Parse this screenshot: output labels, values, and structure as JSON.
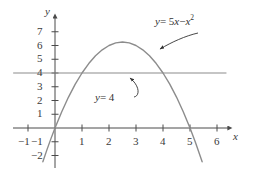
{
  "chart_data": {
    "type": "line",
    "title": "",
    "xlabel": "x",
    "ylabel": "y",
    "xlim": [
      -1.6,
      6.6
    ],
    "ylim": [
      -2.6,
      7.9
    ],
    "grid": false,
    "legend": "none",
    "xticks": [
      -1,
      1,
      2,
      3,
      4,
      5,
      6
    ],
    "xtick_labels": [
      "−1",
      "1",
      "2",
      "3",
      "4",
      "5",
      "6"
    ],
    "yticks": [
      -2,
      -1,
      1,
      2,
      3,
      4,
      5,
      6,
      7
    ],
    "ytick_labels": [
      "−2",
      "−1",
      "1",
      "2",
      "3",
      "4",
      "5",
      "6",
      "7"
    ],
    "series": [
      {
        "name": "y = 5x − x²",
        "kind": "parabola",
        "equation": "y = 5x - x^2",
        "color": "#8c8c8c",
        "vertex": [
          2.5,
          6.25
        ],
        "roots": [
          0,
          5
        ],
        "x_start": -0.45,
        "x_end": 5.45,
        "points": [
          [
            -0.45,
            -2.4525
          ],
          [
            -0.3,
            -1.59
          ],
          [
            -0.15,
            -0.7725
          ],
          [
            0,
            0
          ],
          [
            0.25,
            1.1875
          ],
          [
            0.5,
            2.25
          ],
          [
            0.75,
            3.1875
          ],
          [
            1,
            4
          ],
          [
            1.25,
            4.6875
          ],
          [
            1.5,
            5.25
          ],
          [
            1.75,
            5.6875
          ],
          [
            2,
            6
          ],
          [
            2.25,
            6.1875
          ],
          [
            2.5,
            6.25
          ],
          [
            2.75,
            6.1875
          ],
          [
            3,
            6
          ],
          [
            3.25,
            5.6875
          ],
          [
            3.5,
            5.25
          ],
          [
            3.75,
            4.6875
          ],
          [
            4,
            4
          ],
          [
            4.25,
            3.1875
          ],
          [
            4.5,
            2.25
          ],
          [
            4.75,
            1.1875
          ],
          [
            5,
            0
          ],
          [
            5.2,
            -1.04
          ],
          [
            5.45,
            -2.4525
          ]
        ]
      },
      {
        "name": "y = 4",
        "kind": "horizontal-line",
        "equation": "y = 4",
        "color": "#8c8c8c",
        "value": 4,
        "x_start": -1.55,
        "x_end": 6.35,
        "intersections": [
          [
            1,
            4
          ],
          [
            4,
            4
          ]
        ]
      }
    ],
    "annotations": [
      {
        "id": "curve-label",
        "text": "y = 5x − x²",
        "html_parts": {
          "lhs": "y",
          "eq": " = 5",
          "x1": "x",
          "minus": " − ",
          "x2": "x",
          "exp": "2"
        },
        "target": [
          3.3,
          5.6
        ],
        "arrow": "curved-left-down"
      },
      {
        "id": "line-label",
        "text": "y = 4",
        "html_parts": {
          "lhs": "y",
          "eq": " = 4"
        },
        "target": [
          2.55,
          4
        ],
        "arrow": "curved-up"
      }
    ]
  },
  "axes": {
    "x_name": "x",
    "y_name": "y"
  },
  "colors": {
    "axis": "#4a4a4a",
    "curve": "#8c8c8c",
    "line": "#8c8c8c",
    "text": "#333333",
    "background": "#ffffff"
  },
  "annotation_curve": {
    "y": "y",
    "eq": "= 5",
    "x_var": "x",
    "minus": "−",
    "x_var2": "x",
    "exponent": "2"
  },
  "annotation_line": {
    "y": "y",
    "eq": "= 4"
  },
  "xtick_text": {
    "t0": "−1",
    "t1": "1",
    "t2": "2",
    "t3": "3",
    "t4": "4",
    "t5": "5",
    "t6": "6"
  },
  "ytick_text": {
    "m2": "−2",
    "m1": "−1",
    "p1": "1",
    "p2": "2",
    "p3": "3",
    "p4": "4",
    "p5": "5",
    "p6": "6",
    "p7": "7"
  }
}
